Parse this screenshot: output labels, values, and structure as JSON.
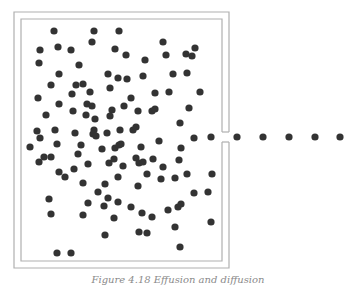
{
  "figure": {
    "caption": "Figure 4.18   Effusion and diffusion",
    "box": {
      "outer": {
        "x": 14,
        "y": 12,
        "w": 215,
        "h": 256
      },
      "inner": {
        "x": 21,
        "y": 19,
        "w": 201,
        "h": 242
      },
      "opening": {
        "y1": 132,
        "y2": 142
      },
      "stroke": "#b0b0b0"
    },
    "dot_color": "#333333",
    "dot_radius": 3.6,
    "escaping_particles": [
      [
        211,
        137
      ],
      [
        237,
        137
      ],
      [
        263,
        137
      ],
      [
        289,
        137
      ],
      [
        315,
        137
      ],
      [
        340,
        137
      ]
    ],
    "particles": [
      [
        54,
        31
      ],
      [
        94,
        31
      ],
      [
        119,
        31
      ],
      [
        92,
        42
      ],
      [
        163,
        42
      ],
      [
        40,
        50
      ],
      [
        58,
        47
      ],
      [
        71,
        50
      ],
      [
        115,
        49
      ],
      [
        126,
        55
      ],
      [
        166,
        55
      ],
      [
        186,
        54
      ],
      [
        192,
        56
      ],
      [
        195,
        48
      ],
      [
        39,
        63
      ],
      [
        79,
        65
      ],
      [
        145,
        60
      ],
      [
        59,
        74
      ],
      [
        108,
        74
      ],
      [
        118,
        78
      ],
      [
        127,
        79
      ],
      [
        143,
        76
      ],
      [
        173,
        74
      ],
      [
        187,
        73
      ],
      [
        51,
        85
      ],
      [
        76,
        85
      ],
      [
        83,
        84
      ],
      [
        110,
        88
      ],
      [
        90,
        92
      ],
      [
        72,
        94
      ],
      [
        155,
        93
      ],
      [
        169,
        92
      ],
      [
        200,
        92
      ],
      [
        38,
        98
      ],
      [
        131,
        98
      ],
      [
        59,
        104
      ],
      [
        87,
        104
      ],
      [
        92,
        106
      ],
      [
        124,
        106
      ],
      [
        73,
        111
      ],
      [
        112,
        110
      ],
      [
        138,
        111
      ],
      [
        152,
        111
      ],
      [
        155,
        109
      ],
      [
        189,
        108
      ],
      [
        46,
        115
      ],
      [
        86,
        115
      ],
      [
        110,
        116
      ],
      [
        95,
        119
      ],
      [
        180,
        123
      ],
      [
        37,
        131
      ],
      [
        55,
        130
      ],
      [
        75,
        133
      ],
      [
        94,
        130
      ],
      [
        93,
        134
      ],
      [
        96,
        136
      ],
      [
        107,
        133
      ],
      [
        120,
        130
      ],
      [
        133,
        130
      ],
      [
        136,
        127
      ],
      [
        40,
        138
      ],
      [
        194,
        138
      ],
      [
        30,
        147
      ],
      [
        57,
        144
      ],
      [
        81,
        145
      ],
      [
        102,
        149
      ],
      [
        115,
        148
      ],
      [
        119,
        145
      ],
      [
        121,
        144
      ],
      [
        141,
        147
      ],
      [
        159,
        141
      ],
      [
        181,
        148
      ],
      [
        78,
        154
      ],
      [
        44,
        157
      ],
      [
        51,
        157
      ],
      [
        39,
        162
      ],
      [
        88,
        164
      ],
      [
        109,
        163
      ],
      [
        114,
        159
      ],
      [
        123,
        166
      ],
      [
        136,
        158
      ],
      [
        139,
        163
      ],
      [
        143,
        162
      ],
      [
        153,
        159
      ],
      [
        163,
        167
      ],
      [
        179,
        160
      ],
      [
        59,
        172
      ],
      [
        65,
        177
      ],
      [
        74,
        169
      ],
      [
        118,
        177
      ],
      [
        147,
        174
      ],
      [
        161,
        179
      ],
      [
        175,
        178
      ],
      [
        187,
        174
      ],
      [
        212,
        174
      ],
      [
        83,
        183
      ],
      [
        105,
        184
      ],
      [
        138,
        186
      ],
      [
        98,
        192
      ],
      [
        194,
        193
      ],
      [
        208,
        192
      ],
      [
        49,
        199
      ],
      [
        108,
        198
      ],
      [
        118,
        202
      ],
      [
        88,
        203
      ],
      [
        104,
        206
      ],
      [
        131,
        207
      ],
      [
        168,
        210
      ],
      [
        178,
        207
      ],
      [
        181,
        204
      ],
      [
        51,
        214
      ],
      [
        83,
        215
      ],
      [
        114,
        218
      ],
      [
        142,
        213
      ],
      [
        152,
        217
      ],
      [
        211,
        222
      ],
      [
        175,
        227
      ],
      [
        105,
        235
      ],
      [
        139,
        232
      ],
      [
        147,
        233
      ],
      [
        180,
        247
      ],
      [
        57,
        253
      ],
      [
        71,
        253
      ]
    ]
  }
}
